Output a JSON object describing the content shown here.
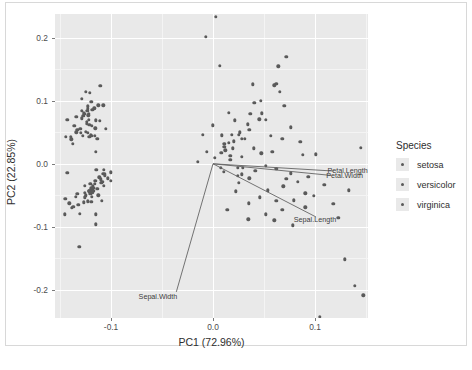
{
  "chart_data": {
    "type": "scatter",
    "title": "",
    "xlabel": "PC1 (72.96%)",
    "ylabel": "PC2 (22.85%)",
    "xlim": [
      -0.155,
      0.152
    ],
    "ylim": [
      -0.245,
      0.238
    ],
    "xticks": [
      -0.1,
      0.0,
      0.1
    ],
    "xticklabels": [
      "-0.1",
      "0.0",
      "0.1"
    ],
    "yticks": [
      0.2,
      0.1,
      0.0,
      -0.1,
      -0.2
    ],
    "yticklabels": [
      "0.2",
      "0.1",
      "0.0",
      "-0.1",
      "-0.2"
    ],
    "grid": true,
    "legend": {
      "title": "Species",
      "position": "right",
      "entries": [
        {
          "label": "setosa",
          "color": "#5a5a5a"
        },
        {
          "label": "versicolor",
          "color": "#5a5a5a"
        },
        {
          "label": "virginica",
          "color": "#5a5a5a"
        }
      ]
    },
    "loadings": [
      {
        "label": "Petal.Length",
        "x": 0.118,
        "y": -0.0115,
        "label_x": 0.132,
        "label_y": -0.0105
      },
      {
        "label": "Petal.Width",
        "x": 0.116,
        "y": -0.0185,
        "label_x": 0.129,
        "label_y": -0.0185
      },
      {
        "label": "Sepal.Length",
        "x": 0.101,
        "y": -0.0845,
        "label_x": 0.1,
        "label_y": -0.088
      },
      {
        "label": "Sepal.Width",
        "x": -0.036,
        "y": -0.2035,
        "label_x": -0.054,
        "label_y": -0.2095
      }
    ],
    "series": [
      {
        "name": "setosa",
        "color": "#5a5a5a",
        "points": [
          [
            -0.1265,
            0.08
          ],
          [
            -0.1185,
            0.0855
          ],
          [
            -0.136,
            0.06
          ],
          [
            -0.1295,
            0.0495
          ],
          [
            -0.1275,
            0.076
          ],
          [
            -0.1125,
            0.093
          ],
          [
            -0.133,
            0.054
          ],
          [
            -0.124,
            0.0665
          ],
          [
            -0.1375,
            0.032
          ],
          [
            -0.123,
            0.049
          ],
          [
            -0.1165,
            0.088
          ],
          [
            -0.1215,
            0.062
          ],
          [
            -0.128,
            0.044
          ],
          [
            -0.1445,
            0.043
          ],
          [
            -0.121,
            0.113
          ],
          [
            -0.1105,
            0.1235
          ],
          [
            -0.1195,
            0.0985
          ],
          [
            -0.1255,
            0.079
          ],
          [
            -0.1075,
            0.093
          ],
          [
            -0.123,
            0.087
          ],
          [
            -0.111,
            0.068
          ],
          [
            -0.122,
            0.0795
          ],
          [
            -0.143,
            0.07
          ],
          [
            -0.1135,
            0.0395
          ],
          [
            -0.1155,
            0.0565
          ],
          [
            -0.116,
            0.044
          ],
          [
            -0.119,
            0.06
          ],
          [
            -0.1225,
            0.077
          ],
          [
            -0.127,
            0.076
          ],
          [
            -0.1245,
            0.051
          ],
          [
            -0.1215,
            0.043
          ],
          [
            -0.115,
            0.069
          ],
          [
            -0.1285,
            0.103
          ],
          [
            -0.1245,
            0.114
          ],
          [
            -0.12,
            0.0455
          ],
          [
            -0.13,
            0.0555
          ],
          [
            -0.1285,
            0.0845
          ],
          [
            -0.134,
            0.0745
          ],
          [
            -0.139,
            0.039
          ],
          [
            -0.122,
            0.07
          ],
          [
            -0.129,
            0.072
          ],
          [
            -0.143,
            -0.014
          ],
          [
            -0.1395,
            0.043
          ],
          [
            -0.115,
            0.0195
          ],
          [
            -0.105,
            0.056
          ],
          [
            -0.119,
            0.044
          ],
          [
            -0.1235,
            0.084
          ],
          [
            -0.134,
            0.05
          ],
          [
            -0.123,
            0.0915
          ],
          [
            -0.124,
            0.064
          ]
        ]
      },
      {
        "name": "versicolor",
        "color": "#5a5a5a",
        "points": [
          [
            -0.1,
            -0.0135
          ],
          [
            -0.1145,
            -0.0095
          ],
          [
            -0.1155,
            -0.027
          ],
          [
            -0.133,
            -0.0475
          ],
          [
            -0.1205,
            -0.032
          ],
          [
            -0.1125,
            -0.05
          ],
          [
            -0.11,
            -0.0245
          ],
          [
            -0.141,
            -0.063
          ],
          [
            -0.108,
            -0.016
          ],
          [
            -0.127,
            -0.061
          ],
          [
            -0.1455,
            -0.08
          ],
          [
            -0.116,
            -0.032
          ],
          [
            -0.1305,
            -0.079
          ],
          [
            -0.113,
            -0.04
          ],
          [
            -0.1255,
            -0.035
          ],
          [
            -0.107,
            -0.01
          ],
          [
            -0.118,
            -0.039
          ],
          [
            -0.126,
            -0.053
          ],
          [
            -0.115,
            -0.096
          ],
          [
            -0.132,
            -0.065
          ],
          [
            -0.1095,
            -0.03
          ],
          [
            -0.1215,
            -0.043
          ],
          [
            -0.109,
            -0.0585
          ],
          [
            -0.1175,
            -0.043
          ],
          [
            -0.1115,
            -0.0215
          ],
          [
            -0.1065,
            -0.016
          ],
          [
            -0.1085,
            -0.029
          ],
          [
            -0.103,
            -0.023
          ],
          [
            -0.117,
            -0.038
          ],
          [
            -0.1345,
            -0.0525
          ],
          [
            -0.137,
            -0.068
          ],
          [
            -0.1385,
            -0.07
          ],
          [
            -0.1255,
            -0.0465
          ],
          [
            -0.115,
            -0.0805
          ],
          [
            -0.107,
            -0.0345
          ],
          [
            -0.1,
            -0.0275
          ],
          [
            -0.106,
            -0.018
          ],
          [
            -0.118,
            -0.0345
          ],
          [
            -0.125,
            -0.05
          ],
          [
            -0.1215,
            -0.044
          ],
          [
            -0.1195,
            -0.0605
          ],
          [
            -0.114,
            -0.04
          ],
          [
            -0.123,
            -0.0595
          ],
          [
            -0.145,
            -0.056
          ],
          [
            -0.1185,
            -0.043
          ],
          [
            -0.119,
            -0.052
          ],
          [
            -0.1195,
            -0.039
          ],
          [
            -0.1205,
            -0.0475
          ],
          [
            -0.131,
            -0.132
          ],
          [
            -0.1185,
            -0.0455
          ]
        ]
      },
      {
        "name": "virginica",
        "color": "#5a5a5a",
        "points": [
          [
            0.0,
            0.061
          ],
          [
            -0.01,
            0.046
          ],
          [
            0.011,
            0.032
          ],
          [
            -0.006,
            0.019
          ],
          [
            0.002,
            0.0095
          ],
          [
            0.028,
            0.04
          ],
          [
            -0.015,
            0.003
          ],
          [
            0.039,
            0.1265
          ],
          [
            0.0075,
            -0.006
          ],
          [
            0.0455,
            0.0705
          ],
          [
            -0.007,
            0.2015
          ],
          [
            0.017,
            0.013
          ],
          [
            0.064,
            0.155
          ],
          [
            0.008,
            0.0175
          ],
          [
            0.026,
            0.05
          ],
          [
            0.0405,
            0.0965
          ],
          [
            0.012,
            0.0215
          ],
          [
            0.003,
            0.234
          ],
          [
            0.072,
            0.17
          ],
          [
            0.011,
            0.027
          ],
          [
            0.034,
            0.0625
          ],
          [
            0.0065,
            0.1555
          ],
          [
            0.062,
            0.1275
          ],
          [
            0.0155,
            0.033
          ],
          [
            0.0255,
            0.0465
          ],
          [
            0.047,
            0.1
          ],
          [
            0.0205,
            0.036
          ],
          [
            0.0195,
            0.0245
          ],
          [
            0.017,
            0.006
          ],
          [
            0.0365,
            0.079
          ],
          [
            0.06,
            0.1245
          ],
          [
            0.0655,
            0.1145
          ],
          [
            0.0245,
            -0.006
          ],
          [
            0.0285,
            0.011
          ],
          [
            0.052,
            0.07
          ],
          [
            0.07,
            0.092
          ],
          [
            0.031,
            0.04
          ],
          [
            0.04,
            0.0245
          ],
          [
            0.0565,
            0.044
          ],
          [
            0.076,
            0.058
          ],
          [
            0.0475,
            0.0165
          ],
          [
            0.068,
            0.0395
          ],
          [
            0.028,
            -0.0165
          ],
          [
            0.0515,
            -0.003
          ],
          [
            0.0855,
            0.035
          ],
          [
            0.101,
            0.015
          ],
          [
            0.062,
            -0.008
          ],
          [
            0.076,
            -0.015
          ],
          [
            0.0355,
            -0.023
          ],
          [
            0.054,
            -0.042
          ],
          [
            0.069,
            -0.036
          ],
          [
            0.083,
            -0.0285
          ],
          [
            0.0905,
            -0.047
          ],
          [
            0.062,
            -0.0585
          ],
          [
            0.046,
            -0.053
          ],
          [
            0.0225,
            -0.044
          ],
          [
            0.035,
            -0.063
          ],
          [
            0.079,
            -0.058
          ],
          [
            0.099,
            -0.051
          ],
          [
            0.014,
            -0.0735
          ],
          [
            0.052,
            -0.08
          ],
          [
            0.068,
            -0.073
          ],
          [
            0.0905,
            -0.069
          ],
          [
            0.118,
            -0.064
          ],
          [
            0.133,
            -0.042
          ],
          [
            0.06,
            -0.09
          ],
          [
            0.078,
            -0.098
          ],
          [
            0.0345,
            -0.0885
          ],
          [
            0.123,
            -0.0855
          ],
          [
            0.0255,
            -0.03
          ],
          [
            0.145,
            0.025
          ],
          [
            0.129,
            -0.152
          ],
          [
            0.139,
            -0.194
          ],
          [
            0.1475,
            -0.209
          ],
          [
            0.105,
            -0.243
          ],
          [
            0.0355,
            0.054
          ],
          [
            0.048,
            0.08
          ],
          [
            0.0155,
            0.081
          ],
          [
            0.0085,
            0.0455
          ],
          [
            0.0215,
            0.069
          ],
          [
            0.088,
            0.0145
          ],
          [
            0.0415,
            -0.011
          ],
          [
            0.0105,
            -0.0125
          ],
          [
            0.029,
            -0.0065
          ],
          [
            0.058,
            0.0195
          ],
          [
            0.0935,
            -0.0205
          ],
          [
            0.072,
            -0.024
          ],
          [
            0.109,
            -0.033
          ],
          [
            0.0245,
            -0.0195
          ],
          [
            0.0185,
            0.046
          ]
        ]
      }
    ]
  }
}
